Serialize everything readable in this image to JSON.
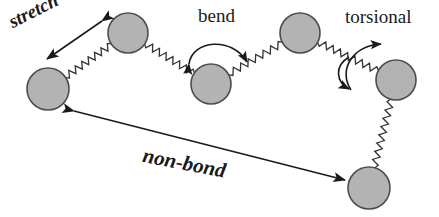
{
  "figure": {
    "width": 439,
    "height": 217,
    "background_color": "#ffffff",
    "atom_fill_color": "#b3b3b3",
    "atom_stroke_color": "#4d4d4d",
    "bond_color": "#333333",
    "arrow_color": "#1a1a1a",
    "label_color": "#1a1a1a"
  },
  "labels": {
    "stretch": "stretch",
    "bend": "bend",
    "torsional": "torsional",
    "nonbond": "non-bond"
  },
  "atoms": [
    {
      "id": "atom-1",
      "cx": 48,
      "cy": 89,
      "r": 21
    },
    {
      "id": "atom-2",
      "cx": 128,
      "cy": 33,
      "r": 20
    },
    {
      "id": "atom-3",
      "cx": 211,
      "cy": 84,
      "r": 20
    },
    {
      "id": "atom-4",
      "cx": 300,
      "cy": 33,
      "r": 20
    },
    {
      "id": "atom-5",
      "cx": 396,
      "cy": 80,
      "r": 20
    },
    {
      "id": "atom-6",
      "cx": 369,
      "cy": 188,
      "r": 21
    }
  ],
  "bonds": [
    {
      "id": "bond-1-2",
      "from": "atom-1",
      "to": "atom-2",
      "style": "spring"
    },
    {
      "id": "bond-2-3",
      "from": "atom-2",
      "to": "atom-3",
      "style": "spring"
    },
    {
      "id": "bond-3-4",
      "from": "atom-3",
      "to": "atom-4",
      "style": "spring"
    },
    {
      "id": "bond-4-5",
      "from": "atom-4",
      "to": "atom-5",
      "style": "spring"
    },
    {
      "id": "bond-5-6",
      "from": "atom-5",
      "to": "atom-6",
      "style": "spring"
    }
  ],
  "annotations": [
    {
      "id": "stretch-arrow",
      "label": "stretch",
      "type": "double-arrow-straight",
      "describes": "bond-1-2"
    },
    {
      "id": "bend-arrow",
      "label": "bend",
      "type": "double-arrow-arc",
      "describes": "atom-3 angle"
    },
    {
      "id": "torsional-arrow",
      "label": "torsional",
      "type": "double-arrow-s-curve",
      "describes": "bond-4-5 rotation"
    },
    {
      "id": "nonbond-arrow",
      "label": "non-bond",
      "type": "double-arrow-straight",
      "describes": "atom-1 to atom-6"
    }
  ]
}
